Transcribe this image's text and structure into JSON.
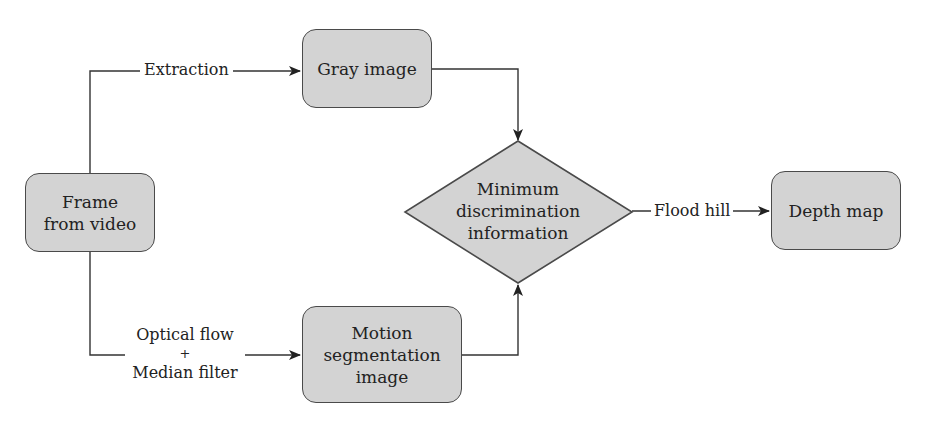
{
  "diagram": {
    "type": "flowchart",
    "colors": {
      "node_fill": "#d3d3d3",
      "stroke": "#4a4a4a",
      "background": "#ffffff"
    },
    "nodes": {
      "frame": {
        "line1": "Frame",
        "line2": "from video"
      },
      "gray": {
        "label": "Gray image"
      },
      "motion": {
        "line1": "Motion",
        "line2": "segmentation",
        "line3": "image"
      },
      "decision": {
        "line1": "Minimum",
        "line2": "discrimination",
        "line3": "information"
      },
      "depth": {
        "label": "Depth map"
      }
    },
    "edges": {
      "extraction": "Extraction",
      "optical_flow": {
        "line1": "Optical flow",
        "line2": "+",
        "line3": "Median filter"
      },
      "flood_hill": "Flood hill"
    }
  }
}
